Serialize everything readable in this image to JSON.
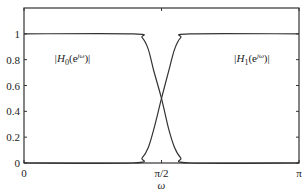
{
  "chart_data": {
    "type": "line",
    "title": "",
    "xlabel": "ω",
    "ylabel": "",
    "xlim": [
      0,
      3.14159
    ],
    "ylim": [
      0,
      1.2
    ],
    "grid": false,
    "x_ticks": [
      {
        "value": 0,
        "label": "0"
      },
      {
        "value": 1.5708,
        "label": "π/2"
      },
      {
        "value": 3.14159,
        "label": "π"
      }
    ],
    "y_ticks": [
      {
        "value": 0,
        "label": "0"
      },
      {
        "value": 0.2,
        "label": "0.2"
      },
      {
        "value": 0.4,
        "label": "0.4"
      },
      {
        "value": 0.6,
        "label": "0.6"
      },
      {
        "value": 0.8,
        "label": "0.8"
      },
      {
        "value": 1,
        "label": "1"
      }
    ],
    "series": [
      {
        "name": "|H0(e^jω)|",
        "label_base": "|H",
        "label_sub": "0",
        "label_tail": "(e",
        "label_sup": "jω",
        "label_close": ")|",
        "x": [
          0,
          1.25,
          1.35,
          1.42,
          1.48,
          1.5708,
          1.65,
          1.72,
          1.79,
          1.89,
          3.14159
        ],
        "y": [
          1,
          1,
          0.97,
          0.88,
          0.72,
          0.5,
          0.27,
          0.12,
          0.04,
          0,
          0
        ]
      },
      {
        "name": "|H1(e^jω)|",
        "label_base": "|H",
        "label_sub": "1",
        "label_tail": "(e",
        "label_sup": "jω",
        "label_close": ")|",
        "x": [
          0,
          1.25,
          1.35,
          1.42,
          1.49,
          1.5708,
          1.66,
          1.72,
          1.79,
          1.89,
          3.14159
        ],
        "y": [
          0,
          0,
          0.04,
          0.12,
          0.28,
          0.5,
          0.73,
          0.88,
          0.97,
          1,
          1
        ]
      }
    ],
    "annotations": [
      {
        "text": "|H0(e^jω)|",
        "x": 0.55,
        "y": 0.78
      },
      {
        "text": "|H1(e^jω)|",
        "x": 2.6,
        "y": 0.78
      }
    ]
  }
}
